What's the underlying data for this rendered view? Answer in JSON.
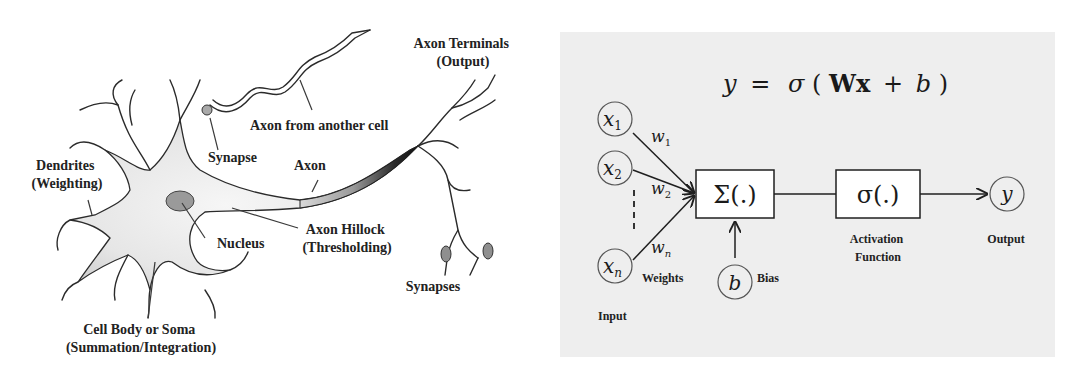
{
  "biological_neuron": {
    "labels": {
      "axon_terminals": [
        "Axon Terminals",
        "(Output)"
      ],
      "axon_from_another_cell": "Axon from another cell",
      "synapse": "Synapse",
      "axon": "Axon",
      "dendrites": [
        "Dendrites",
        "(Weighting)"
      ],
      "nucleus": "Nucleus",
      "axon_hillock": [
        "Axon Hillock",
        "(Thresholding)"
      ],
      "synapses": "Synapses",
      "cell_body": [
        "Cell Body or Soma",
        "(Summation/Integration)"
      ]
    },
    "colors": {
      "soma_fill": "#e9e9e9",
      "nucleus_fill": "#9a9a9a",
      "axon_dark": "#1e1e1e",
      "synapse_fill": "#8f8f8f"
    }
  },
  "artificial_neuron": {
    "equation": {
      "lhs": "y",
      "equals": "=",
      "sigma": "σ",
      "open": "(",
      "weights_bold": "Wx",
      "plus": "+",
      "bias": "b",
      "close": ")"
    },
    "inputs": [
      {
        "symbol": "x",
        "subscript": "1",
        "weight": "w",
        "weight_subscript": "1"
      },
      {
        "symbol": "x",
        "subscript": "2",
        "weight": "w",
        "weight_subscript": "2"
      },
      {
        "symbol": "x",
        "subscript": "n",
        "weight": "w",
        "weight_subscript": "n"
      }
    ],
    "summation_block": "Σ(.)",
    "activation_block": "σ(.)",
    "bias_node": "b",
    "output_node": "y",
    "labels": {
      "input": "Input",
      "weights": "Weights",
      "bias": "Bias",
      "activation": [
        "Activation",
        "Function"
      ],
      "output": "Output"
    },
    "colors": {
      "background": "#eeeeee",
      "block_fill": "#ffffff",
      "stroke": "#1f1f1f"
    }
  }
}
